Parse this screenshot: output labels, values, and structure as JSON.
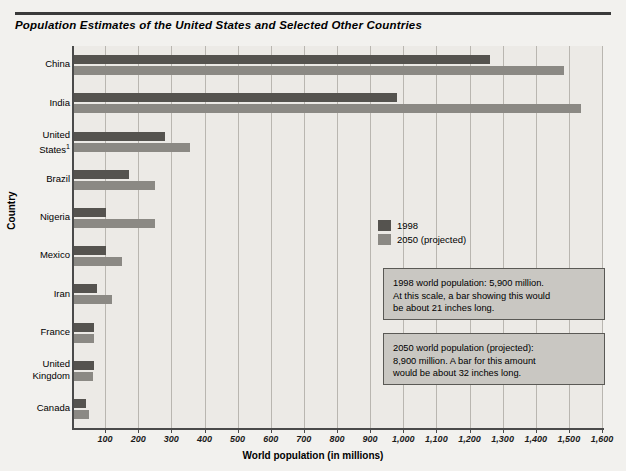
{
  "header": {
    "title": "Population Estimates of the United States and Selected Other Countries"
  },
  "legend": {
    "items": [
      {
        "label": "1998",
        "color": "#55534f"
      },
      {
        "label": "2050 (projected)",
        "color": "#8b8984"
      }
    ]
  },
  "callouts": {
    "c1998": "1998 world population: 5,900 million.\nAt this scale, a bar showing this would\nbe about 21 inches long.",
    "c2050": "2050 world population (projected):\n8,900 million. A bar for this amount\nwould be about 32 inches long."
  },
  "footnote_marker": "1",
  "chart_data": {
    "type": "bar",
    "orientation": "horizontal",
    "title": "Population Estimates of the United States and Selected Other Countries",
    "xlabel": "World population (in millions)",
    "ylabel": "Country",
    "xlim": [
      0,
      1600
    ],
    "xticks": [
      100,
      200,
      300,
      400,
      500,
      600,
      700,
      800,
      900,
      1000,
      1100,
      1200,
      1300,
      1400,
      1500,
      1600
    ],
    "xticklabels": [
      "100",
      "200",
      "300",
      "400",
      "500",
      "600",
      "700",
      "800",
      "900",
      "1,000",
      "1,100",
      "1,200",
      "1,300",
      "1,400",
      "1,500",
      "1,600"
    ],
    "grid": "vertical",
    "legend_position": "center-right",
    "categories": [
      "China",
      "India",
      "United\nStates",
      "Brazil",
      "Nigeria",
      "Mexico",
      "Iran",
      "France",
      "United\nKingdom",
      "Canada"
    ],
    "series": [
      {
        "name": "1998",
        "color": "#55534f",
        "values": [
          1255,
          976,
          275,
          166,
          97,
          98,
          70,
          59,
          59,
          36
        ]
      },
      {
        "name": "2050 (projected)",
        "color": "#8b8984",
        "values": [
          1480,
          1530,
          350,
          244,
          244,
          145,
          115,
          59,
          58,
          45
        ]
      }
    ]
  }
}
